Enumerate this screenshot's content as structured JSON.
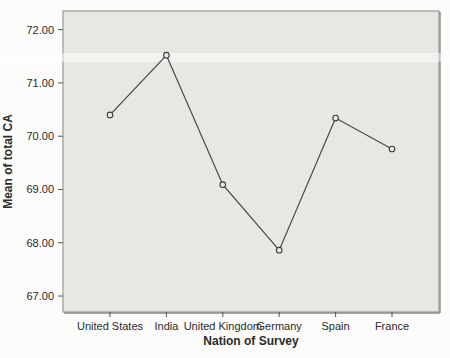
{
  "figure": {
    "page_bg": "#fcfcfa"
  },
  "chart_data": {
    "type": "line",
    "title": "",
    "xlabel": "Nation of Survey",
    "ylabel": "Mean of total CA",
    "categories": [
      "United States",
      "India",
      "United Kingdom",
      "Germany",
      "Spain",
      "France"
    ],
    "values": [
      70.4,
      71.52,
      69.09,
      67.86,
      70.34,
      69.76
    ],
    "ylim": [
      66.7,
      72.35
    ],
    "yticks": [
      67,
      68,
      69,
      70,
      71,
      72
    ],
    "ytick_labels": [
      "67.00",
      "68.00",
      "69.00",
      "70.00",
      "71.00",
      "72.00"
    ],
    "grid": false,
    "legend_position": "none",
    "marker": "open-circle",
    "colors": {
      "line": "#474747",
      "marker_stroke": "#3d3d3d",
      "marker_fill": "#e9e9e6",
      "plot_bg": "#e7e7e4",
      "frame": "#9a9a9a",
      "frame_shadow": "#8a8a8a",
      "tick": "#555555",
      "text": "#2b2b2b",
      "scan_band": "rgba(255,255,255,0.45)"
    }
  }
}
